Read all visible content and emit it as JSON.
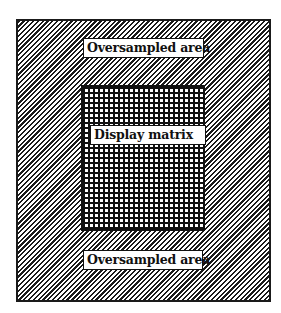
{
  "diagram": {
    "outer_region": {
      "label": "Oversampled area",
      "fill_pattern": "diagonal-hatch",
      "colors": {
        "stroke": "#1a1a1a",
        "background": "#ffffff"
      }
    },
    "inner_region": {
      "label": "Display matrix",
      "fill_pattern": "square-grid",
      "colors": {
        "stroke": "#111111",
        "background": "#ffffff"
      }
    },
    "labels": {
      "top": "Oversampled area",
      "middle": "Display matrix",
      "bottom": "Oversampled area"
    }
  }
}
